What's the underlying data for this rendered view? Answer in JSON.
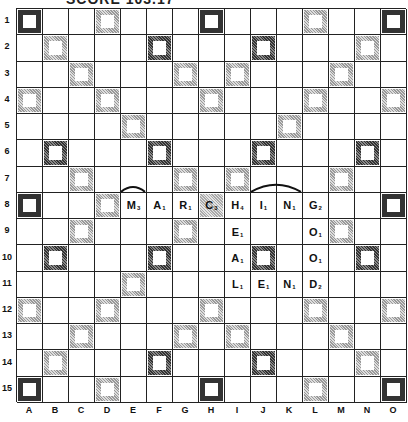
{
  "title": "SCORE 103.17",
  "board": {
    "rows": [
      "1",
      "2",
      "3",
      "4",
      "5",
      "6",
      "7",
      "8",
      "9",
      "10",
      "11",
      "12",
      "13",
      "14",
      "15"
    ],
    "cols": [
      "A",
      "B",
      "C",
      "D",
      "E",
      "F",
      "G",
      "H",
      "I",
      "J",
      "K",
      "L",
      "M",
      "N",
      "O"
    ],
    "premium_squares": [
      {
        "r": 1,
        "c": 1,
        "t": "dotted"
      },
      {
        "r": 1,
        "c": 4,
        "t": "light"
      },
      {
        "r": 1,
        "c": 8,
        "t": "dotted"
      },
      {
        "r": 1,
        "c": 12,
        "t": "light"
      },
      {
        "r": 1,
        "c": 15,
        "t": "dotted"
      },
      {
        "r": 2,
        "c": 2,
        "t": "light"
      },
      {
        "r": 2,
        "c": 6,
        "t": "dark"
      },
      {
        "r": 2,
        "c": 10,
        "t": "dark"
      },
      {
        "r": 2,
        "c": 14,
        "t": "light"
      },
      {
        "r": 3,
        "c": 3,
        "t": "light"
      },
      {
        "r": 3,
        "c": 7,
        "t": "light"
      },
      {
        "r": 3,
        "c": 9,
        "t": "light"
      },
      {
        "r": 3,
        "c": 13,
        "t": "light"
      },
      {
        "r": 4,
        "c": 1,
        "t": "light"
      },
      {
        "r": 4,
        "c": 4,
        "t": "light"
      },
      {
        "r": 4,
        "c": 8,
        "t": "light"
      },
      {
        "r": 4,
        "c": 12,
        "t": "light"
      },
      {
        "r": 4,
        "c": 15,
        "t": "light"
      },
      {
        "r": 5,
        "c": 5,
        "t": "light"
      },
      {
        "r": 5,
        "c": 11,
        "t": "light"
      },
      {
        "r": 6,
        "c": 2,
        "t": "dark"
      },
      {
        "r": 6,
        "c": 6,
        "t": "dark"
      },
      {
        "r": 6,
        "c": 10,
        "t": "dark"
      },
      {
        "r": 6,
        "c": 14,
        "t": "dark"
      },
      {
        "r": 7,
        "c": 3,
        "t": "light"
      },
      {
        "r": 7,
        "c": 7,
        "t": "light"
      },
      {
        "r": 7,
        "c": 9,
        "t": "light"
      },
      {
        "r": 7,
        "c": 13,
        "t": "light"
      },
      {
        "r": 8,
        "c": 1,
        "t": "dotted"
      },
      {
        "r": 8,
        "c": 4,
        "t": "light"
      },
      {
        "r": 8,
        "c": 8,
        "t": "star"
      },
      {
        "r": 8,
        "c": 12,
        "t": "light"
      },
      {
        "r": 8,
        "c": 15,
        "t": "dotted"
      },
      {
        "r": 9,
        "c": 3,
        "t": "light"
      },
      {
        "r": 9,
        "c": 7,
        "t": "light"
      },
      {
        "r": 9,
        "c": 9,
        "t": "light"
      },
      {
        "r": 9,
        "c": 13,
        "t": "light"
      },
      {
        "r": 10,
        "c": 2,
        "t": "dark"
      },
      {
        "r": 10,
        "c": 6,
        "t": "dark"
      },
      {
        "r": 10,
        "c": 10,
        "t": "dark"
      },
      {
        "r": 10,
        "c": 14,
        "t": "dark"
      },
      {
        "r": 11,
        "c": 5,
        "t": "light"
      },
      {
        "r": 11,
        "c": 11,
        "t": "light"
      },
      {
        "r": 12,
        "c": 1,
        "t": "light"
      },
      {
        "r": 12,
        "c": 4,
        "t": "light"
      },
      {
        "r": 12,
        "c": 8,
        "t": "light"
      },
      {
        "r": 12,
        "c": 12,
        "t": "light"
      },
      {
        "r": 12,
        "c": 15,
        "t": "light"
      },
      {
        "r": 13,
        "c": 3,
        "t": "light"
      },
      {
        "r": 13,
        "c": 7,
        "t": "light"
      },
      {
        "r": 13,
        "c": 9,
        "t": "light"
      },
      {
        "r": 13,
        "c": 13,
        "t": "light"
      },
      {
        "r": 14,
        "c": 2,
        "t": "light"
      },
      {
        "r": 14,
        "c": 6,
        "t": "dark"
      },
      {
        "r": 14,
        "c": 10,
        "t": "dark"
      },
      {
        "r": 14,
        "c": 14,
        "t": "light"
      },
      {
        "r": 15,
        "c": 1,
        "t": "dotted"
      },
      {
        "r": 15,
        "c": 4,
        "t": "light"
      },
      {
        "r": 15,
        "c": 8,
        "t": "dotted"
      },
      {
        "r": 15,
        "c": 12,
        "t": "light"
      },
      {
        "r": 15,
        "c": 15,
        "t": "dotted"
      }
    ],
    "tiles": [
      {
        "r": 8,
        "c": 5,
        "letter": "M",
        "value": "3"
      },
      {
        "r": 8,
        "c": 6,
        "letter": "A",
        "value": "1"
      },
      {
        "r": 8,
        "c": 7,
        "letter": "R",
        "value": "1"
      },
      {
        "r": 8,
        "c": 8,
        "letter": "C",
        "value": "3"
      },
      {
        "r": 8,
        "c": 9,
        "letter": "H",
        "value": "4"
      },
      {
        "r": 8,
        "c": 10,
        "letter": "I",
        "value": "1"
      },
      {
        "r": 8,
        "c": 11,
        "letter": "N",
        "value": "1"
      },
      {
        "r": 8,
        "c": 12,
        "letter": "G",
        "value": "2"
      },
      {
        "r": 9,
        "c": 9,
        "letter": "E",
        "value": "1"
      },
      {
        "r": 10,
        "c": 9,
        "letter": "A",
        "value": "1"
      },
      {
        "r": 11,
        "c": 9,
        "letter": "L",
        "value": "1"
      },
      {
        "r": 9,
        "c": 12,
        "letter": "O",
        "value": "1"
      },
      {
        "r": 10,
        "c": 12,
        "letter": "O",
        "value": "1"
      },
      {
        "r": 11,
        "c": 12,
        "letter": "D",
        "value": "2"
      },
      {
        "r": 11,
        "c": 10,
        "letter": "E",
        "value": "1"
      },
      {
        "r": 11,
        "c": 11,
        "letter": "N",
        "value": "1"
      }
    ],
    "arcs": [
      {
        "row": 8,
        "from_col": 5,
        "to_col": 5
      },
      {
        "row": 8,
        "from_col": 10,
        "to_col": 11
      }
    ]
  }
}
